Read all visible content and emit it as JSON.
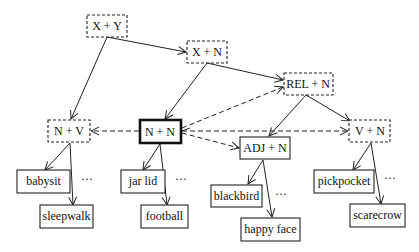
{
  "diagram": {
    "nodes": {
      "x_plus_y": {
        "label": "X + Y",
        "style": "dashed"
      },
      "x_plus_n": {
        "label": "X + N",
        "style": "dashed"
      },
      "rel_plus_n": {
        "label": "REL + N",
        "style": "dashed"
      },
      "n_plus_v": {
        "label": "N + V",
        "style": "dashed"
      },
      "n_plus_n": {
        "label": "N + N",
        "style": "bold"
      },
      "adj_plus_n": {
        "label": "ADJ + N",
        "style": "solid"
      },
      "v_plus_n": {
        "label": "V + N",
        "style": "dashed"
      },
      "babysit": {
        "label": "babysit",
        "style": "solid"
      },
      "sleepwalk": {
        "label": "sleepwalk",
        "style": "solid"
      },
      "jar_lid": {
        "label": "jar lid",
        "style": "solid"
      },
      "football": {
        "label": "football",
        "style": "solid"
      },
      "blackbird": {
        "label": "blackbird",
        "style": "solid"
      },
      "happy_face": {
        "label": "happy face",
        "style": "solid"
      },
      "pickpocket": {
        "label": "pickpocket",
        "style": "solid"
      },
      "scarecrow": {
        "label": "scarecrow",
        "style": "solid"
      }
    },
    "ellipsis": "···",
    "edges": [
      {
        "from": "X + Y",
        "to": "X + N",
        "type": "solid"
      },
      {
        "from": "X + Y",
        "to": "N + V",
        "type": "solid"
      },
      {
        "from": "X + N",
        "to": "N + N",
        "type": "solid"
      },
      {
        "from": "X + N",
        "to": "REL + N",
        "type": "solid"
      },
      {
        "from": "REL + N",
        "to": "ADJ + N",
        "type": "solid"
      },
      {
        "from": "REL + N",
        "to": "V + N",
        "type": "solid"
      },
      {
        "from": "N + V",
        "to": "babysit",
        "type": "solid"
      },
      {
        "from": "N + V",
        "to": "sleepwalk",
        "type": "solid"
      },
      {
        "from": "N + N",
        "to": "jar lid",
        "type": "solid"
      },
      {
        "from": "N + N",
        "to": "football",
        "type": "solid"
      },
      {
        "from": "ADJ + N",
        "to": "blackbird",
        "type": "solid"
      },
      {
        "from": "ADJ + N",
        "to": "happy face",
        "type": "solid"
      },
      {
        "from": "V + N",
        "to": "pickpocket",
        "type": "solid"
      },
      {
        "from": "V + N",
        "to": "scarecrow",
        "type": "solid"
      },
      {
        "from": "N + N",
        "to": "N + V",
        "type": "dashed"
      },
      {
        "from": "N + N",
        "to": "REL + N",
        "type": "dashed"
      },
      {
        "from": "N + N",
        "to": "ADJ + N",
        "type": "dashed"
      },
      {
        "from": "N + N",
        "to": "V + N",
        "type": "dashed"
      }
    ]
  }
}
